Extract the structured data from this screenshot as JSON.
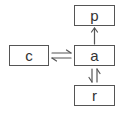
{
  "diagram": {
    "nodes": [
      {
        "id": "p",
        "label": "p",
        "x": 74,
        "y": 5,
        "w": 41,
        "h": 21
      },
      {
        "id": "c",
        "label": "c",
        "x": 9,
        "y": 45,
        "w": 40,
        "h": 21
      },
      {
        "id": "a",
        "label": "a",
        "x": 74,
        "y": 45,
        "w": 41,
        "h": 21
      },
      {
        "id": "r",
        "label": "r",
        "x": 74,
        "y": 85,
        "w": 41,
        "h": 21
      }
    ],
    "edges": [
      {
        "from": "a",
        "to": "p",
        "type": "single-arrow"
      },
      {
        "from": "c",
        "to": "a",
        "type": "equilibrium-horizontal"
      },
      {
        "from": "a",
        "to": "r",
        "type": "equilibrium-vertical"
      }
    ],
    "colors": {
      "stroke": "#555555",
      "text": "#333333",
      "background": "#ffffff"
    }
  }
}
